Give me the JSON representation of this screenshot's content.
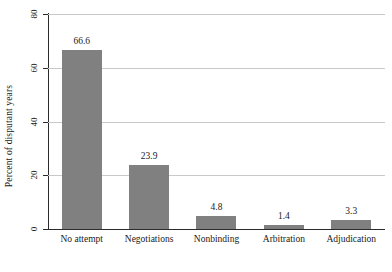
{
  "chart_data": {
    "type": "bar",
    "title": "",
    "xlabel": "",
    "ylabel": "Percent of disputant years",
    "categories": [
      "No attempt",
      "Negotiations",
      "Nonbinding",
      "Arbitration",
      "Adjudication"
    ],
    "values": [
      66.6,
      23.9,
      4.8,
      1.4,
      3.3
    ],
    "value_labels": [
      "66.6",
      "23.9",
      "4.8",
      "1.4",
      "3.3"
    ],
    "ylim": [
      0,
      80
    ],
    "yticks": [
      0,
      20,
      40,
      60,
      80
    ],
    "ytick_labels": [
      "0",
      "20",
      "40",
      "60",
      "80"
    ],
    "gridlines": [
      20,
      40,
      60,
      80
    ],
    "grid": true,
    "legend": false,
    "bar_color": "#808080",
    "grid_color": "#c9c9c9",
    "axis_color": "#2b2b2b",
    "background": "#ffffff"
  }
}
